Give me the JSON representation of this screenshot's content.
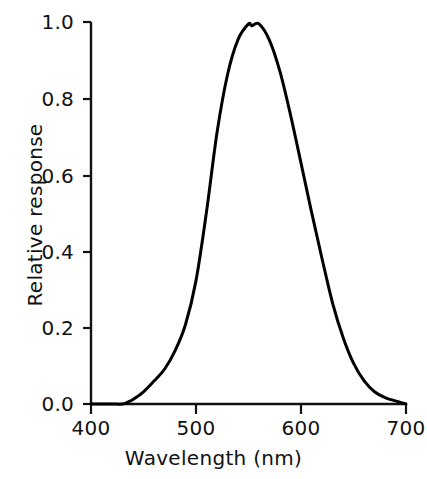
{
  "chart_data": {
    "type": "line",
    "title": "",
    "xlabel": "Wavelength (nm)",
    "ylabel": "Relative response",
    "xlim": [
      400,
      700
    ],
    "ylim": [
      0.0,
      1.0
    ],
    "xticks": [
      400,
      500,
      600,
      700
    ],
    "xtick_labels": [
      "400",
      "500",
      "600",
      "700"
    ],
    "yticks": [
      0.0,
      0.2,
      0.4,
      0.6,
      0.8,
      1.0
    ],
    "ytick_labels": [
      "0.0",
      "0.2",
      "0.4",
      "0.6",
      "0.8",
      "1.0"
    ],
    "grid": false,
    "legend": null,
    "line_color": "#000000",
    "line_width": 3,
    "background_color": "#ffffff",
    "series": [
      {
        "name": "Relative response",
        "x": [
          400,
          410,
          420,
          430,
          435,
          440,
          450,
          460,
          470,
          480,
          490,
          500,
          510,
          520,
          530,
          540,
          550,
          553,
          560,
          570,
          580,
          590,
          600,
          610,
          620,
          630,
          640,
          650,
          660,
          670,
          680,
          690,
          700
        ],
        "values": [
          0.0,
          0.0,
          0.0,
          0.0,
          0.005,
          0.012,
          0.032,
          0.06,
          0.091,
          0.139,
          0.208,
          0.323,
          0.503,
          0.71,
          0.862,
          0.954,
          0.995,
          0.99,
          0.995,
          0.952,
          0.87,
          0.757,
          0.631,
          0.503,
          0.381,
          0.265,
          0.175,
          0.107,
          0.061,
          0.032,
          0.017,
          0.008,
          0.0
        ]
      }
    ],
    "annotations": {
      "peak_wavelength_nm": 553,
      "peak_value": 0.99,
      "onset_wavelength_nm": 433
    }
  },
  "axes": {
    "y_tick_marks": [
      {
        "label": "1.0",
        "value": 1.0
      },
      {
        "label": "0.8",
        "value": 0.8
      },
      {
        "label": "0.6",
        "value": 0.6
      },
      {
        "label": "0.4",
        "value": 0.4
      },
      {
        "label": "0.2",
        "value": 0.2
      },
      {
        "label": "0.0",
        "value": 0.0
      }
    ],
    "x_tick_marks": [
      {
        "label": "400",
        "value": 400
      },
      {
        "label": "500",
        "value": 500
      },
      {
        "label": "600",
        "value": 600
      },
      {
        "label": "700",
        "value": 700
      }
    ]
  }
}
